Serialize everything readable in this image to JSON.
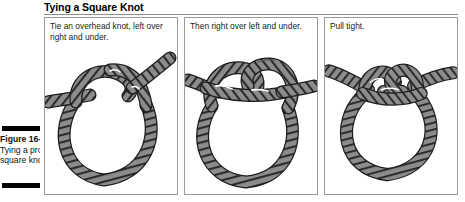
{
  "figure": {
    "title": "Tying a Square Knot",
    "caption_label": "Figure 16-1:",
    "caption_line2": "Tying a proper",
    "caption_line3": "square knot.",
    "caption_full": "Figure 16-1: Tying a proper square knot."
  },
  "panels": [
    {
      "id": "panel-1",
      "caption": "Tie an overhead knot, left over right and under.",
      "art": "rope-overhand-knot-loop"
    },
    {
      "id": "panel-2",
      "caption": "Then right over left and under.",
      "art": "rope-second-crossing-knot"
    },
    {
      "id": "panel-3",
      "caption": "Pull tight.",
      "art": "rope-tightened-square-knot"
    }
  ],
  "colors": {
    "rope_fill": "#8c8c8c",
    "rope_outline": "#1c1c1c",
    "rope_hatch": "#2b2b2b",
    "panel_border": "#9a9a9a",
    "rule": "#8d8d8d",
    "text": "#222222",
    "caption_bar": "#000000"
  }
}
